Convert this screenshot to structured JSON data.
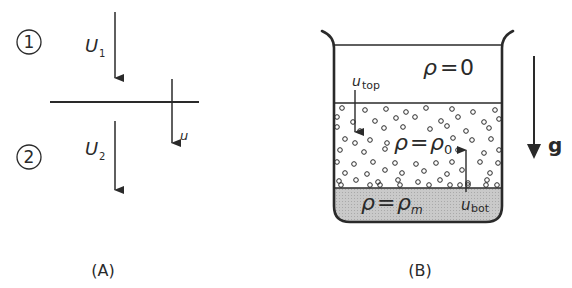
{
  "panel_a": {
    "caption": "(A)",
    "region_1_label": "1",
    "region_2_label": "2",
    "velocity_1": {
      "symbol": "U",
      "subscript": "1"
    },
    "velocity_2": {
      "symbol": "U",
      "subscript": "2"
    },
    "interface_velocity": "u"
  },
  "panel_b": {
    "caption": "(B)",
    "top_layer_label": {
      "lhs": "ρ",
      "eq": "=",
      "rhs": "0"
    },
    "middle_layer_label": {
      "lhs": "ρ",
      "eq": "=",
      "rhs": "ρ",
      "rhs_sub": "0"
    },
    "bottom_layer_label": {
      "lhs": "ρ",
      "eq": "=",
      "rhs": "ρ",
      "rhs_sub": "m"
    },
    "top_velocity": {
      "symbol": "u",
      "subscript": "top"
    },
    "bottom_velocity": {
      "symbol": "u",
      "subscript": "bot"
    },
    "gravity_label": "g",
    "colors": {
      "stroke": "#2a2a2a",
      "sediment_fill": "#c9c9c9",
      "background": "#ffffff"
    }
  }
}
